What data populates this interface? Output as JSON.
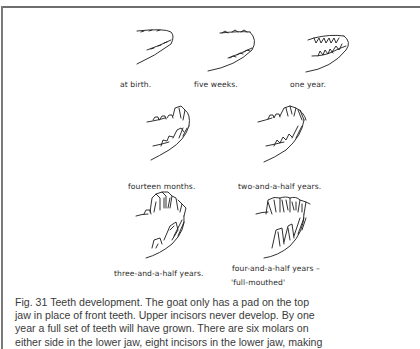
{
  "figure": {
    "number": "Fig. 31",
    "stages": [
      {
        "id": "at-birth",
        "label": "at birth."
      },
      {
        "id": "five-weeks",
        "label": "five weeks."
      },
      {
        "id": "one-year",
        "label": "one year."
      },
      {
        "id": "fourteen-months",
        "label": "fourteen months."
      },
      {
        "id": "two-and-a-half-years",
        "label": "two-and-a-half years."
      },
      {
        "id": "three-and-a-half-years",
        "label": "three-and-a-half years."
      },
      {
        "id": "four-and-a-half-years",
        "label": "four-and-a-half years –",
        "label_line2": "'full-mouthed'"
      }
    ]
  },
  "caption": {
    "lines": [
      "Fig. 31  Teeth development. The goat only has a pad on the top",
      "jaw in place of front teeth. Upper incisors never develop. By one",
      "year a full set of teeth will have grown. There are six molars on",
      "either side in the lower jaw, eight incisors in the lower jaw, making"
    ]
  }
}
